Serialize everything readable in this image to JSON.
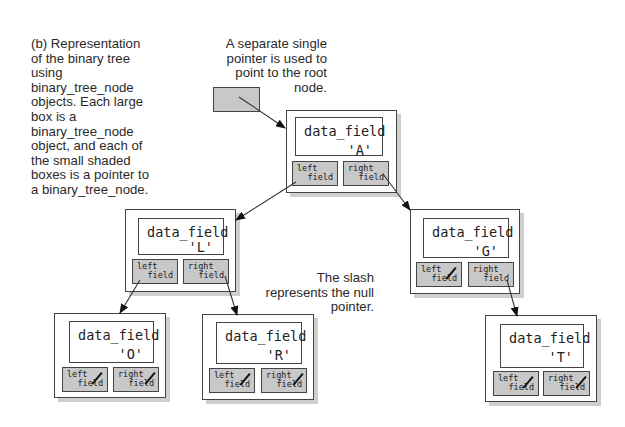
{
  "captions": {
    "left_description": [
      "(b) Representation",
      "of the binary tree",
      "using",
      "binary_tree_node",
      "objects. Each large",
      "box is a",
      "binary_tree_node",
      "object, and each of",
      "the small shaded",
      "boxes is a pointer to",
      "a binary_tree_node."
    ],
    "root_pointer_note": [
      "A separate single",
      "pointer is used to",
      "point to the root",
      "node."
    ],
    "null_note": [
      "The slash",
      "represents the null",
      "pointer."
    ]
  },
  "node_labels": {
    "data_field": "data_field",
    "left_top": "left",
    "right_top": "right",
    "field": "field"
  },
  "nodes": [
    {
      "id": "A",
      "value": "'A'",
      "left": "L",
      "right": "G",
      "left_null": false,
      "right_null": false
    },
    {
      "id": "L",
      "value": "'L'",
      "left": "O",
      "right": "R",
      "left_null": false,
      "right_null": false
    },
    {
      "id": "G",
      "value": "'G'",
      "left": null,
      "right": "T",
      "left_null": true,
      "right_null": false
    },
    {
      "id": "O",
      "value": "'O'",
      "left": null,
      "right": null,
      "left_null": true,
      "right_null": true
    },
    {
      "id": "R",
      "value": "'R'",
      "left": null,
      "right": null,
      "left_null": true,
      "right_null": true
    },
    {
      "id": "T",
      "value": "'T'",
      "left": null,
      "right": null,
      "left_null": true,
      "right_null": true
    }
  ],
  "colors": {
    "pointer_fill": "#c8c8c8",
    "border": "#444444",
    "shadow": "#cfcfcf"
  }
}
